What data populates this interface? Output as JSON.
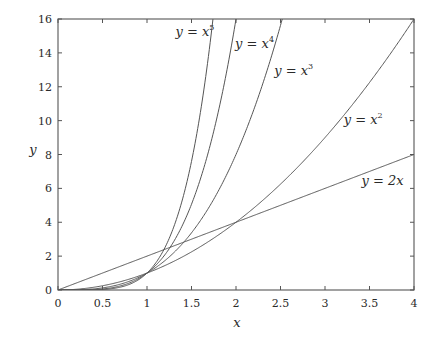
{
  "chart_data": {
    "type": "line",
    "title": "",
    "xlabel": "x",
    "ylabel": "y",
    "xlim": [
      0,
      4
    ],
    "ylim": [
      0,
      16
    ],
    "grid": false,
    "legend": "inline labels",
    "x_ticks": [
      0,
      0.5,
      1,
      1.5,
      2,
      2.5,
      3,
      3.5,
      4
    ],
    "x_tick_labels": [
      "0",
      "0.5",
      "1",
      "1.5",
      "2",
      "2.5",
      "3",
      "3.5",
      "4"
    ],
    "y_ticks": [
      0,
      2,
      4,
      6,
      8,
      10,
      12,
      14,
      16
    ],
    "y_tick_labels": [
      "0",
      "2",
      "4",
      "6",
      "8",
      "10",
      "12",
      "14",
      "16"
    ],
    "series": [
      {
        "name": "y = x^5",
        "label_base": "y = x",
        "label_exp": "5",
        "exponent": 5,
        "formula": "x^5",
        "x": [
          0,
          0.5,
          1,
          1.25,
          1.5,
          1.74
        ],
        "y": [
          0,
          0.03,
          1,
          3.05,
          7.59,
          16
        ]
      },
      {
        "name": "y = x^4",
        "label_base": "y = x",
        "label_exp": "4",
        "exponent": 4,
        "formula": "x^4",
        "x": [
          0,
          0.5,
          1,
          1.5,
          1.75,
          2
        ],
        "y": [
          0,
          0.06,
          1,
          5.06,
          9.38,
          16
        ]
      },
      {
        "name": "y = x^3",
        "label_base": "y = x",
        "label_exp": "3",
        "exponent": 3,
        "formula": "x^3",
        "x": [
          0,
          0.5,
          1,
          1.5,
          2,
          2.52
        ],
        "y": [
          0,
          0.13,
          1,
          3.38,
          8,
          16
        ]
      },
      {
        "name": "y = x^2",
        "label_base": "y = x",
        "label_exp": "2",
        "exponent": 2,
        "formula": "x^2",
        "x": [
          0,
          0.5,
          1,
          2,
          3,
          4
        ],
        "y": [
          0,
          0.25,
          1,
          4,
          9,
          16
        ]
      },
      {
        "name": "y = 2x",
        "label_base": "y = 2x",
        "label_exp": "",
        "exponent": 1,
        "formula": "2x",
        "x": [
          0,
          1,
          2,
          3,
          4
        ],
        "y": [
          0,
          2,
          4,
          6,
          8
        ]
      }
    ],
    "annotations": [
      {
        "series": "y = x^5",
        "x": 1.32,
        "y": 15.0
      },
      {
        "series": "y = x^4",
        "x": 1.99,
        "y": 14.3
      },
      {
        "series": "y = x^3",
        "x": 2.43,
        "y": 12.7
      },
      {
        "series": "y = x^2",
        "x": 3.21,
        "y": 9.8
      },
      {
        "series": "y = 2x",
        "x": 3.41,
        "y": 6.2
      }
    ]
  },
  "layout": {
    "plot": {
      "left": 58,
      "top": 19,
      "right": 414,
      "bottom": 290
    },
    "line_color": "#555555",
    "frame_color": "#555555"
  }
}
